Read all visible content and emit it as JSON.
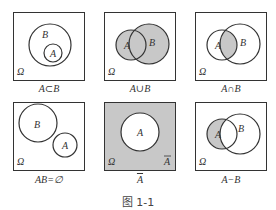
{
  "figure": {
    "caption": "图 1-1",
    "colors": {
      "shade": "#c8c8c8",
      "stroke": "#333333",
      "background": "#ffffff"
    },
    "panels": [
      {
        "label": "A⊂B",
        "omega": "Ω",
        "set_a": "A",
        "set_b": "B",
        "relation": "subset"
      },
      {
        "label": "A∪B",
        "omega": "Ω",
        "set_a": "A",
        "set_b": "B",
        "relation": "union"
      },
      {
        "label": "A∩B",
        "omega": "Ω",
        "set_a": "A",
        "set_b": "B",
        "relation": "intersection"
      },
      {
        "label": "AB=∅",
        "omega": "Ω",
        "set_a": "A",
        "set_b": "B",
        "relation": "disjoint"
      },
      {
        "label": "A̅",
        "omega": "Ω",
        "set_a": "A",
        "complement": "A̅",
        "relation": "complement"
      },
      {
        "label": "A−B",
        "omega": "Ω",
        "set_a": "A",
        "set_b": "B",
        "relation": "difference"
      }
    ]
  }
}
